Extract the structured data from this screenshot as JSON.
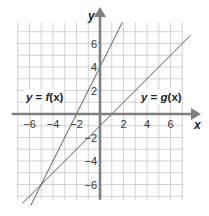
{
  "chart_data": {
    "type": "line",
    "title": "",
    "xlabel": "x",
    "ylabel": "y",
    "xlim": [
      -7,
      7
    ],
    "ylim": [
      -7.3,
      7.8
    ],
    "grid": true,
    "x_ticks": [
      -6,
      -4,
      -2,
      2,
      4,
      6
    ],
    "y_ticks": [
      6,
      4,
      2,
      -2,
      -4,
      -6
    ],
    "x_tick_labels": [
      "−6",
      "−4",
      "−2",
      "2",
      "4",
      "6"
    ],
    "y_tick_labels": [
      "6",
      "4",
      "2",
      "−2",
      "−4",
      "−6"
    ],
    "series": [
      {
        "name": "y = f(x)",
        "equation": "f(x) = 2x + 4",
        "slope": 2,
        "intercept": 4,
        "x_range": [
          -5.9,
          1.9
        ],
        "points": [
          [
            -5.9,
            -7.8
          ],
          [
            -5,
            -6
          ],
          [
            -2,
            0
          ],
          [
            0,
            4
          ],
          [
            1.9,
            7.8
          ]
        ]
      },
      {
        "name": "y = g(x)",
        "equation": "g(x) = x - 1",
        "slope": 1,
        "intercept": -1,
        "x_range": [
          -6.6,
          7.7
        ],
        "points": [
          [
            -6.6,
            -7.6
          ],
          [
            -5,
            -6
          ],
          [
            0,
            -1
          ],
          [
            1,
            0
          ],
          [
            7.7,
            6.7
          ]
        ]
      }
    ],
    "annotations": [
      {
        "text": "y = f(x)",
        "x": -5.4,
        "y": 1.3
      },
      {
        "text": "y = g(x)",
        "x": 5.4,
        "y": 1.3
      }
    ],
    "intersection": [
      -5,
      -6
    ]
  },
  "labels": {
    "x_axis": "x",
    "y_axis": "y",
    "f_label_var": "y",
    "f_label_eq": " = ",
    "f_label_fn": "f",
    "f_label_arg": "(x)",
    "g_label_var": "y",
    "g_label_eq": " = ",
    "g_label_fn": "g",
    "g_label_arg": "(x)"
  },
  "colors": {
    "axis": "#7f7f7f",
    "grid": "#c8c8c8",
    "lines": "#4a4a4a",
    "text": "#222222",
    "background": "#ffffff"
  }
}
